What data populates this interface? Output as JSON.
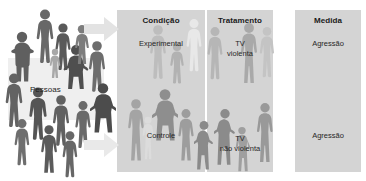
{
  "diagram": {
    "type": "experiment-design-flow",
    "language": "pt-BR",
    "colors": {
      "panel_background": "#d4d4d4",
      "page_background": "#ffffff",
      "figure_dark": "#6b6b6b",
      "figure_mid": "#9a9a9a",
      "figure_light": "#bdbdbd",
      "arrow": "#e2e2e2",
      "text": "#1a1a1a"
    },
    "source_group": {
      "label": "Pessoas"
    },
    "arrows": [
      {
        "name": "arrow-to-experimental",
        "direction": "right"
      },
      {
        "name": "arrow-to-controle",
        "direction": "right"
      }
    ],
    "columns": [
      {
        "key": "condicao",
        "title": "Condição",
        "cells": [
          {
            "key": "experimental",
            "label": "Experimental"
          },
          {
            "key": "controle",
            "label": "Controle"
          }
        ]
      },
      {
        "key": "tratamento",
        "title": "Tratamento",
        "cells": [
          {
            "key": "tv-violenta",
            "label": "TV\nviolenta",
            "line1": "TV",
            "line2": "violenta"
          },
          {
            "key": "tv-nao-violenta",
            "label": "TV\nnão violenta",
            "line1": "TV",
            "line2": "não violenta"
          }
        ]
      },
      {
        "key": "medida",
        "title": "Medida",
        "cells": [
          {
            "key": "agressao-top",
            "label": "Agressão"
          },
          {
            "key": "agressao-bottom",
            "label": "Agressão"
          }
        ]
      }
    ]
  }
}
